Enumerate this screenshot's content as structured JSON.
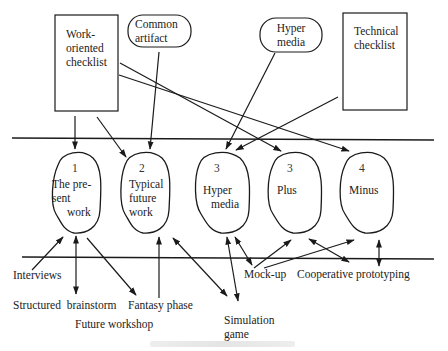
{
  "diagram": {
    "sources": {
      "work_oriented_checklist": "Work-\noriented\nchecklist",
      "work_oriented_checklist_lines": [
        "Work-",
        "oriented",
        "checklist"
      ],
      "common_artifact_lines": [
        "Common",
        "artifact"
      ],
      "hyper_media_lines": [
        "Hyper",
        "media"
      ],
      "technical_checklist_lines": [
        "Technical",
        "checklist"
      ]
    },
    "mockups": [
      {
        "number": "1",
        "lines": [
          "The pre-",
          "sent",
          "work"
        ]
      },
      {
        "number": "2",
        "lines": [
          "Typical",
          "future",
          "work"
        ]
      },
      {
        "number": "3",
        "lines": [
          "Hyper",
          "media"
        ]
      },
      {
        "number": "3",
        "lines": [
          "Plus"
        ]
      },
      {
        "number": "4",
        "lines": [
          "Minus"
        ]
      }
    ],
    "techniques": {
      "interviews": "Interviews",
      "structured_brainstorm": "Structured  brainstorm",
      "fantasy_phase": "Fantasy phase",
      "future_workshop": "Future workshop",
      "simulation_game_lines": [
        "Simulation",
        "game"
      ],
      "mock_up": "Mock-up",
      "cooperative_prototyping": "Cooperative prototyping"
    },
    "colors": {
      "stroke": "#1a1a1a",
      "background": "#ffffff"
    }
  }
}
